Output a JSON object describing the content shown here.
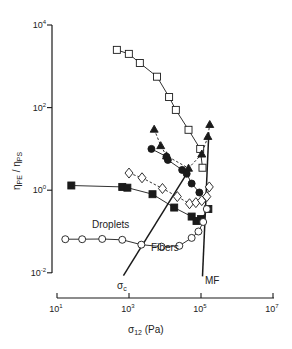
{
  "chart_data": {
    "type": "scatter",
    "title": "",
    "xlabel": "σ12 (Pa)",
    "ylabel": "ηPE / ηPS",
    "xscale": "log",
    "yscale": "log",
    "xlim": [
      10,
      10000000
    ],
    "ylim": [
      0.01,
      10000
    ],
    "x_ticks": [
      {
        "value": 10,
        "base": "10",
        "exp": "1"
      },
      {
        "value": 1000,
        "base": "10",
        "exp": "3"
      },
      {
        "value": 100000,
        "base": "10",
        "exp": "5"
      },
      {
        "value": 10000000,
        "base": "10",
        "exp": "7"
      }
    ],
    "y_ticks": [
      {
        "value": 10000,
        "base": "10",
        "exp": "4"
      },
      {
        "value": 100,
        "base": "10",
        "exp": "2"
      },
      {
        "value": 1,
        "base": "10",
        "exp": "0"
      },
      {
        "value": 0.01,
        "base": "10",
        "exp": "-2"
      }
    ],
    "grid": false,
    "legend": null,
    "series": [
      {
        "name": "open-squares",
        "marker": "square-open",
        "line": "solid",
        "points": [
          [
            460,
            2500
          ],
          [
            990,
            2000
          ],
          [
            2000,
            1200
          ],
          [
            6000,
            560
          ],
          [
            13000,
            180
          ],
          [
            20000,
            88
          ],
          [
            45000,
            29
          ],
          [
            95000,
            10
          ],
          [
            110000,
            3.5
          ]
        ]
      },
      {
        "name": "filled-triangles",
        "marker": "triangle-filled",
        "line": "dashed",
        "points": [
          [
            5000,
            30
          ],
          [
            7600,
            12
          ],
          [
            11000,
            6.8
          ],
          [
            45000,
            3.4
          ],
          [
            105000,
            7.5
          ],
          [
            155000,
            20
          ],
          [
            175000,
            39
          ]
        ]
      },
      {
        "name": "filled-circles",
        "marker": "circle-filled",
        "line": "solid",
        "points": [
          [
            4200,
            10
          ],
          [
            11000,
            6.5
          ],
          [
            12000,
            5.4
          ],
          [
            30000,
            3.1
          ],
          [
            40000,
            2.5
          ],
          [
            55000,
            1.45
          ],
          [
            90000,
            0.88
          ]
        ]
      },
      {
        "name": "open-diamonds",
        "marker": "diamond-open",
        "line": "dashed",
        "points": [
          [
            1000,
            2.6
          ],
          [
            2300,
            2.0
          ],
          [
            8500,
            1.1
          ],
          [
            22000,
            0.7
          ],
          [
            48000,
            0.47
          ],
          [
            72000,
            0.5
          ],
          [
            105000,
            0.56
          ],
          [
            145000,
            0.7
          ],
          [
            170000,
            1.2
          ]
        ]
      },
      {
        "name": "filled-squares",
        "marker": "square-filled",
        "line": "solid",
        "points": [
          [
            25,
            1.3
          ],
          [
            650,
            1.2
          ],
          [
            900,
            1.15
          ],
          [
            4500,
            0.8
          ],
          [
            18000,
            0.38
          ],
          [
            55000,
            0.23
          ],
          [
            75000,
            0.18
          ],
          [
            100000,
            0.2
          ],
          [
            160000,
            0.35
          ]
        ]
      },
      {
        "name": "open-circles",
        "marker": "circle-open",
        "line": "solid",
        "points": [
          [
            17,
            0.065
          ],
          [
            50,
            0.065
          ],
          [
            180,
            0.066
          ],
          [
            650,
            0.063
          ],
          [
            2200,
            0.048
          ],
          [
            8000,
            0.043
          ],
          [
            25000,
            0.045
          ],
          [
            55000,
            0.07
          ],
          [
            85000,
            0.1
          ],
          [
            115000,
            0.17
          ],
          [
            145000,
            0.35
          ]
        ]
      }
    ],
    "reference_lines": [
      {
        "name": "σc",
        "label": "σc",
        "from": [
          700,
          0.0085
        ],
        "to": [
          41000,
          2.6
        ]
      },
      {
        "name": "MF",
        "label": "MF",
        "from": [
          110000,
          0.0082
        ],
        "to": [
          165000,
          25
        ]
      }
    ],
    "annotations": [
      {
        "text": "Droplets",
        "at_px": [
          108,
          225
        ]
      },
      {
        "text": "Fibers",
        "at_px": [
          164,
          248
        ]
      },
      {
        "text": "σc",
        "at_px": [
          124,
          286
        ]
      },
      {
        "text": "MF",
        "at_px": [
          206,
          283
        ]
      }
    ]
  },
  "labels": {
    "xlabel_main": "σ",
    "xlabel_sub": "12",
    "xlabel_unit": " (Pa)",
    "ylabel_eta1": "η",
    "ylabel_sub1": "PE",
    "ylabel_sep": " / ",
    "ylabel_eta2": "η",
    "ylabel_sub2": "PS",
    "droplets": "Droplets",
    "fibers": "Fibers",
    "sigma_c_main": "σ",
    "sigma_c_sub": "c",
    "mf": "MF"
  }
}
